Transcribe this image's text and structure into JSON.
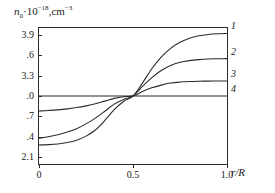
{
  "chart_data": {
    "type": "line",
    "title": "",
    "ylabel_text": "n0 ·10⁻¹⁸, cm⁻³",
    "ylabel_parts": {
      "symbol": "n",
      "subscript": "0",
      "dot": "·",
      "base": "10",
      "exponent": "−18",
      "comma": ",",
      "unit": "cm",
      "unit_exp": "−3"
    },
    "xlabel": "r/R",
    "xlim": [
      0,
      1.0
    ],
    "ylim": [
      2.0,
      4.0
    ],
    "grid": false,
    "legend_position": "right-inline",
    "xticks": [
      0,
      0.5,
      1.0
    ],
    "xtick_labels": [
      "0",
      "0.5",
      "1.0"
    ],
    "yticks": [
      3.9,
      3.6,
      3.3,
      3.0,
      2.7,
      2.4,
      2.1
    ],
    "ytick_labels": [
      "3.9",
      ".6",
      "3.3",
      ".0",
      ".7",
      ".4",
      "2.1"
    ],
    "x": [
      0,
      0.05,
      0.1,
      0.15,
      0.2,
      0.25,
      0.3,
      0.35,
      0.4,
      0.45,
      0.5,
      0.55,
      0.6,
      0.65,
      0.7,
      0.75,
      0.8,
      0.85,
      0.9,
      0.95,
      1.0
    ],
    "series": [
      {
        "name": "1",
        "label": "1",
        "color": "#2b2b2b",
        "crossing_point": [
          0.5,
          3.0
        ],
        "y_start": 2.28,
        "y_end": 3.92,
        "values": [
          2.28,
          2.285,
          2.295,
          2.315,
          2.35,
          2.41,
          2.5,
          2.64,
          2.8,
          2.92,
          3.0,
          3.19,
          3.4,
          3.57,
          3.7,
          3.79,
          3.85,
          3.885,
          3.905,
          3.915,
          3.92
        ]
      },
      {
        "name": "2",
        "label": "2",
        "color": "#2b2b2b",
        "crossing_point": [
          0.5,
          3.0
        ],
        "y_start": 2.38,
        "y_end": 3.55,
        "values": [
          2.38,
          2.4,
          2.43,
          2.47,
          2.52,
          2.59,
          2.675,
          2.775,
          2.88,
          2.95,
          3.0,
          3.14,
          3.27,
          3.375,
          3.45,
          3.495,
          3.52,
          3.535,
          3.545,
          3.548,
          3.55
        ]
      },
      {
        "name": "3",
        "label": "3",
        "color": "#2b2b2b",
        "crossing_point": [
          0.5,
          3.0
        ],
        "y_start": 2.78,
        "y_end": 3.22,
        "values": [
          2.78,
          2.787,
          2.796,
          2.81,
          2.83,
          2.855,
          2.885,
          2.925,
          2.965,
          2.99,
          3.0,
          3.065,
          3.12,
          3.16,
          3.19,
          3.205,
          3.213,
          3.217,
          3.219,
          3.22,
          3.22
        ]
      },
      {
        "name": "4",
        "label": "4",
        "color": "#2b2b2b",
        "crossing_point": [
          0.5,
          3.0
        ],
        "y_start": 3.0,
        "y_end": 3.0,
        "values": [
          3.0,
          3.0,
          3.0,
          3.0,
          3.0,
          3.0,
          3.0,
          3.0,
          3.0,
          3.0,
          3.0,
          3.0,
          3.0,
          3.0,
          3.0,
          3.0,
          3.0,
          3.0,
          3.0,
          3.0,
          3.0
        ]
      }
    ]
  },
  "axis": {
    "frame_color": "#2b2b2b"
  }
}
